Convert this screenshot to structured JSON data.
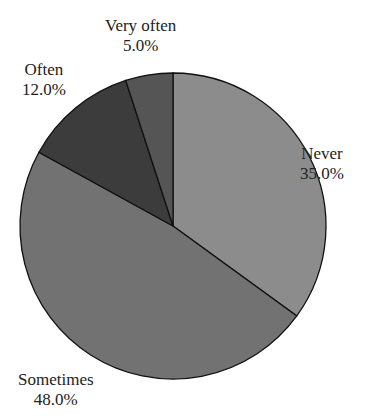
{
  "chart_data": {
    "type": "pie",
    "title": "",
    "categories": [
      "Never",
      "Sometimes",
      "Often",
      "Very often"
    ],
    "values": [
      35.0,
      48.0,
      12.0,
      5.0
    ],
    "labels": [
      "35.0%",
      "48.0%",
      "12.0%",
      "5.0%"
    ],
    "colors": [
      "#8c8c8c",
      "#727272",
      "#3c3c3c",
      "#555555"
    ],
    "start_angle_deg": 90,
    "direction": "clockwise",
    "legend": "none"
  },
  "slices": [
    {
      "name": "Never",
      "pct": "35.0%"
    },
    {
      "name": "Sometimes",
      "pct": "48.0%"
    },
    {
      "name": "Often",
      "pct": "12.0%"
    },
    {
      "name": "Very often",
      "pct": "5.0%"
    }
  ]
}
